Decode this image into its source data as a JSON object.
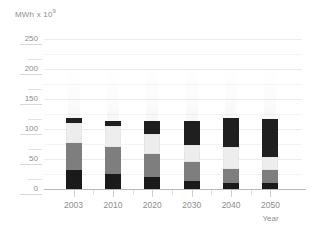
{
  "chart_data": {
    "type": "bar",
    "stacked": true,
    "title": "",
    "subtitle": "",
    "ylabel": "MWh x 10⁹",
    "ylabel_base": "MWh x 10",
    "ylabel_exponent": "9",
    "xlabel": "Year",
    "categories": [
      "2003",
      "2010",
      "2020",
      "2030",
      "2040",
      "2050"
    ],
    "ylim": [
      0,
      250
    ],
    "yticks": [
      0,
      50,
      100,
      150,
      200,
      250
    ],
    "ytick_labels": [
      "0",
      "50",
      "100",
      "150",
      "200",
      "250"
    ],
    "yticks_minor": [
      25,
      75,
      125,
      175,
      225
    ],
    "grid": true,
    "legend": "none",
    "series": [
      {
        "name": "segment-1",
        "color": "#1a1a1a",
        "values": [
          33,
          27,
          21,
          15,
          11,
          12
        ]
      },
      {
        "name": "segment-2",
        "color": "#7e7e7e",
        "values": [
          45,
          44,
          39,
          32,
          24,
          21
        ]
      },
      {
        "name": "segment-3",
        "color": "#ededed",
        "values": [
          33,
          35,
          34,
          28,
          36,
          22
        ]
      },
      {
        "name": "segment-4",
        "color": "#1f1f1f",
        "values": [
          9,
          9,
          21,
          40,
          49,
          64
        ]
      }
    ],
    "totals": [
      120,
      115,
      115,
      115,
      120,
      119
    ]
  },
  "axis": {
    "y_title": "MWh x 10",
    "y_title_sup": "9",
    "x_title": "Year"
  },
  "colors": {
    "gridline": "#ececec",
    "gridline_minor": "#f4f4f4",
    "baseline": "#b9b9b9",
    "tick": "#d8d8d8",
    "text": "#8d8d8d",
    "background": "#ffffff"
  }
}
